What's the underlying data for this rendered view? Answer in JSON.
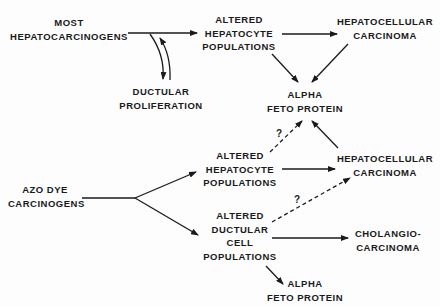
{
  "diagram": {
    "nodes": {
      "most_hepatocarcinogens": {
        "line1": "MOST",
        "line2": "HEPATOCARCINOGENS"
      },
      "ductular_proliferation": {
        "line1": "DUCTULAR",
        "line2": "PROLIFERATION"
      },
      "altered_hepatocyte_1": {
        "line1": "ALTERED",
        "line2": "HEPATOCYTE",
        "line3": "POPULATIONS"
      },
      "hepatocellular_carcinoma_1": {
        "line1": "HEPATOCELLULAR",
        "line2": "CARCINOMA"
      },
      "alpha_feto_protein_1": {
        "line1": "ALPHA",
        "line2": "FETO PROTEIN"
      },
      "azo_dye_carcinogens": {
        "line1": "AZO DYE",
        "line2": "CARCINOGENS"
      },
      "altered_hepatocyte_2": {
        "line1": "ALTERED",
        "line2": "HEPATOCYTE",
        "line3": "POPULATIONS"
      },
      "hepatocellular_carcinoma_2": {
        "line1": "HEPATOCELLULAR",
        "line2": "CARCINOMA"
      },
      "altered_ductular": {
        "line1": "ALTERED",
        "line2": "DUCTULAR",
        "line3": "CELL",
        "line4": "POPULATIONS"
      },
      "cholangiocarcinoma": {
        "line1": "CHOLANGIO-",
        "line2": "CARCINOMA"
      },
      "alpha_feto_protein_2": {
        "line1": "ALPHA",
        "line2": "FETO PROTEIN"
      }
    },
    "annotations": {
      "q1": "?",
      "q2": "?"
    },
    "edges": [
      {
        "from": "most_hepatocarcinogens",
        "to": "altered_hepatocyte_1",
        "style": "solid"
      },
      {
        "from": "most_hepatocarcinogens",
        "to": "ductular_proliferation",
        "style": "solid",
        "bidirectional": true
      },
      {
        "from": "altered_hepatocyte_1",
        "to": "hepatocellular_carcinoma_1",
        "style": "solid"
      },
      {
        "from": "altered_hepatocyte_1",
        "to": "alpha_feto_protein_1",
        "style": "solid"
      },
      {
        "from": "hepatocellular_carcinoma_1",
        "to": "alpha_feto_protein_1",
        "style": "solid"
      },
      {
        "from": "azo_dye_carcinogens",
        "to": "altered_hepatocyte_2",
        "style": "solid"
      },
      {
        "from": "azo_dye_carcinogens",
        "to": "altered_ductular",
        "style": "solid"
      },
      {
        "from": "altered_hepatocyte_2",
        "to": "alpha_feto_protein_1",
        "style": "dashed",
        "label": "?"
      },
      {
        "from": "altered_hepatocyte_2",
        "to": "hepatocellular_carcinoma_2",
        "style": "solid"
      },
      {
        "from": "hepatocellular_carcinoma_2",
        "to": "alpha_feto_protein_1",
        "style": "solid"
      },
      {
        "from": "altered_ductular",
        "to": "hepatocellular_carcinoma_2",
        "style": "dashed",
        "label": "?"
      },
      {
        "from": "altered_ductular",
        "to": "cholangiocarcinoma",
        "style": "solid"
      },
      {
        "from": "altered_ductular",
        "to": "alpha_feto_protein_2",
        "style": "solid"
      }
    ],
    "colors": {
      "ink": "#1a1a1a",
      "background": "#fdfdfd"
    }
  }
}
